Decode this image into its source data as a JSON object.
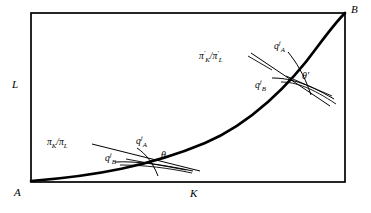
{
  "figure": {
    "type": "economics-isoquant-diagram",
    "background_color": "#ffffff",
    "line_color": "#000000",
    "box": {
      "left": 31,
      "top": 13,
      "right": 345,
      "bottom": 182,
      "border_width": 1.6
    },
    "corner_labels": {
      "origin_A": "A",
      "opposite_B": "B"
    },
    "axis_labels": {
      "vertical": "L",
      "horizontal": "K"
    },
    "curve": {
      "name": "efficiency-locus",
      "description": "convex contract curve from A to B",
      "stroke_width": 2.6
    },
    "tangency_lower": {
      "point_label": "θ",
      "price_ratio_label_pi": "π",
      "price_ratio_sub_K": "K",
      "price_ratio_sub_L": "L",
      "price_ratio_text": "πK/πL",
      "isoquant_A_base": "q",
      "isoquant_A_sup": "j",
      "isoquant_A_sub": "A",
      "isoquant_B_base": "q",
      "isoquant_B_sup": "j",
      "isoquant_B_sub": "B"
    },
    "tangency_upper": {
      "point_label": "θ′",
      "price_ratio_text": "π′K/π′L",
      "price_ratio_label_pi": "π",
      "price_ratio_prime": "′",
      "price_ratio_sub_K": "K",
      "price_ratio_sub_L": "L",
      "isoquant_A_base": "q",
      "isoquant_A_sup": "j",
      "isoquant_A_sub": "A",
      "isoquant_B_base": "q",
      "isoquant_B_sup": "j",
      "isoquant_B_sub": "B"
    }
  }
}
